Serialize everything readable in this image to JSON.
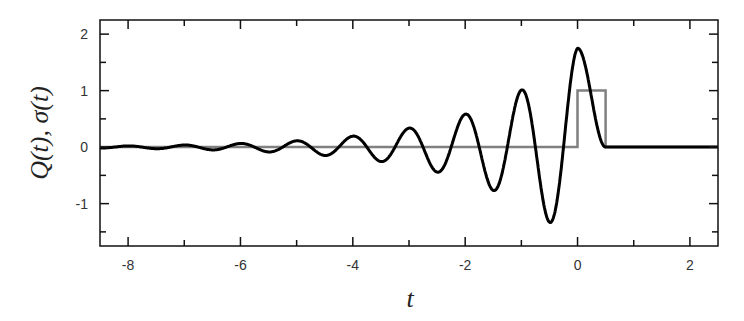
{
  "chart_data": {
    "type": "line",
    "title": "",
    "xlabel": "t",
    "ylabel": "Q(t), σ(t)",
    "xlim": [
      -8.5,
      2.5
    ],
    "ylim": [
      -1.75,
      2.25
    ],
    "grid": false,
    "legend": null,
    "x_ticks": [
      -8,
      -6,
      -4,
      -2,
      0,
      2
    ],
    "x_tick_labels": [
      "-8",
      "-6",
      "-4",
      "-2",
      "0",
      "2"
    ],
    "x_minor_ticks": [
      -7,
      -5,
      -3,
      -1,
      1
    ],
    "y_ticks": [
      -1,
      0,
      1,
      2
    ],
    "y_tick_labels": [
      "-1",
      "0",
      "1",
      "2"
    ],
    "y_minor_ticks": [
      -1.5,
      -0.5,
      0.5,
      1.5
    ],
    "series": [
      {
        "name": "Q(t)",
        "color": "#000000",
        "line_width": 3,
        "description": "damped oscillation growing toward t=0, period 1, envelope ~1.75·exp(0.55 t), decays to 0 at t=0.5 and stays 0",
        "key_points": [
          {
            "t": -5,
            "value": 0.11
          },
          {
            "t": -4.5,
            "value": -0.15
          },
          {
            "t": -4,
            "value": 0.19
          },
          {
            "t": -3.5,
            "value": -0.25
          },
          {
            "t": -3,
            "value": 0.33
          },
          {
            "t": -2.5,
            "value": -0.43
          },
          {
            "t": -2,
            "value": 0.58
          },
          {
            "t": -1.5,
            "value": -0.75
          },
          {
            "t": -1,
            "value": 1.0
          },
          {
            "t": -0.5,
            "value": -1.33
          },
          {
            "t": 0,
            "value": 1.75
          },
          {
            "t": 0.5,
            "value": 0.0
          },
          {
            "t": 2.5,
            "value": 0.0
          }
        ],
        "model": {
          "amplitude": 1.75,
          "growth_rate": 0.55,
          "period": 1.0,
          "cutoff": 0.5
        }
      },
      {
        "name": "σ(t)",
        "color": "#808080",
        "line_width": 2.5,
        "description": "rectangular pulse",
        "x": [
          -8.5,
          0,
          0,
          0.5,
          0.5,
          2.5
        ],
        "values": [
          0,
          0,
          1,
          1,
          0,
          0
        ]
      }
    ]
  }
}
